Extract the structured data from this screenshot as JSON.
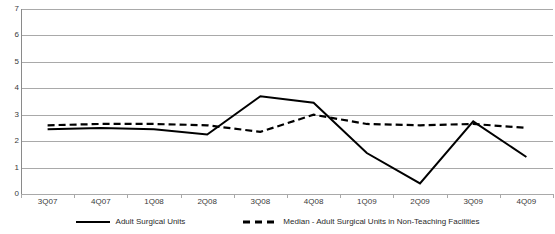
{
  "chart_data": {
    "type": "line",
    "title": "",
    "xlabel": "",
    "ylabel": "",
    "categories": [
      "3Q07",
      "4Q07",
      "1Q08",
      "2Q08",
      "3Q08",
      "4Q08",
      "1Q09",
      "2Q09",
      "3Q09",
      "4Q09"
    ],
    "ylim": [
      0,
      7
    ],
    "yticks": [
      0,
      1,
      2,
      3,
      4,
      5,
      6,
      7
    ],
    "ytick_labels": [
      "0",
      "1",
      "2",
      "3",
      "4",
      "5",
      "6",
      "7"
    ],
    "grid": true,
    "legend_position": "bottom",
    "series": [
      {
        "name": "Adult Surgical Units",
        "style": "solid",
        "color": "#000000",
        "values": [
          2.45,
          2.5,
          2.45,
          2.25,
          3.7,
          3.45,
          1.55,
          0.4,
          2.75,
          1.4
        ]
      },
      {
        "name": "Median - Adult Surgical Units in Non-Teaching Facilities",
        "style": "dashed",
        "color": "#000000",
        "values": [
          2.6,
          2.65,
          2.65,
          2.6,
          2.35,
          3.0,
          2.65,
          2.6,
          2.65,
          2.5
        ]
      }
    ]
  },
  "legend": {
    "items": [
      {
        "label": "Adult Surgical Units",
        "style": "solid"
      },
      {
        "label": "Median - Adult Surgical Units in Non-Teaching Facilities",
        "style": "dashed"
      }
    ]
  },
  "colors": {
    "gridline": "#a9a9a9",
    "axis": "#8a8a8a",
    "series": "#000000",
    "text": "#3a3a3a",
    "background": "#ffffff"
  }
}
